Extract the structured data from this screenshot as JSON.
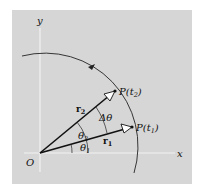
{
  "diagram": {
    "type": "kinematics-polar-angle-diagram",
    "colors": {
      "panel": "#d6d6d6",
      "axes": "#f2f2f2",
      "lines": "#111111"
    },
    "axes": {
      "x_label": "x",
      "y_label": "y",
      "origin_label": "O"
    },
    "points": [
      {
        "name": "P(t₂)",
        "base": "P(t",
        "sub": "2",
        "end": ")"
      },
      {
        "name": "P(t₁)",
        "base": "P(t",
        "sub": "1",
        "end": ")"
      }
    ],
    "vectors": [
      {
        "name": "r₂",
        "base": "r",
        "sub": "2"
      },
      {
        "name": "r₁",
        "base": "r",
        "sub": "1"
      }
    ],
    "angles": [
      {
        "name": "θ₁",
        "base": "θ",
        "sub": "1"
      },
      {
        "name": "θ₂",
        "base": "θ",
        "sub": "2"
      },
      {
        "name": "Δθ",
        "base": "Δθ"
      }
    ],
    "path": {
      "description": "circular arc centered at O, counterclockwise direction arrow"
    }
  }
}
